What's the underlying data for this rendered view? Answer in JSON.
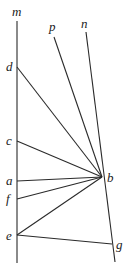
{
  "diagram": {
    "title": "",
    "labels": {
      "m": "m",
      "p": "p",
      "n": "n",
      "d": "d",
      "c": "c",
      "a": "a",
      "f": "f",
      "e": "e",
      "b": "b",
      "g": "g"
    },
    "points": {
      "d": [
        17,
        67
      ],
      "c": [
        17,
        141
      ],
      "a": [
        17,
        181
      ],
      "f": [
        17,
        199
      ],
      "e": [
        17,
        235
      ],
      "b": [
        102,
        177
      ],
      "g": [
        112,
        244
      ]
    },
    "lines": [
      {
        "name": "line-m",
        "from": [
          17,
          21
        ],
        "to": [
          17,
          263
        ]
      },
      {
        "name": "line-n",
        "from": [
          86,
          32
        ],
        "to": [
          115,
          262
        ]
      },
      {
        "name": "line-p",
        "from": [
          54,
          37
        ],
        "to": [
          102,
          177
        ]
      },
      {
        "name": "segment-db",
        "from": "d",
        "to": "b"
      },
      {
        "name": "segment-cb",
        "from": "c",
        "to": "b"
      },
      {
        "name": "segment-ab",
        "from": "a",
        "to": "b"
      },
      {
        "name": "segment-fb",
        "from": "f",
        "to": "b"
      },
      {
        "name": "segment-eb",
        "from": "e",
        "to": "b"
      },
      {
        "name": "segment-eg",
        "from": "e",
        "to": "g"
      }
    ],
    "colors": {
      "stroke": "#2a2a2a",
      "background": "#ffffff",
      "text": "#222222"
    }
  }
}
